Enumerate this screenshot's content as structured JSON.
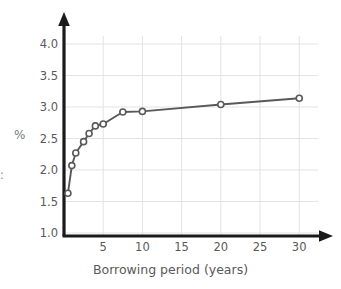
{
  "chart_data": {
    "type": "line",
    "title": "",
    "subtitle": "",
    "xlabel": "Borrowing period (years)",
    "ylabel": "%",
    "xlim": [
      0,
      31.5
    ],
    "ylim": [
      1.0,
      4.2
    ],
    "grid": true,
    "legend": null,
    "series": [
      {
        "name": "Interest rate",
        "marker": "open-circle",
        "color": "#595959",
        "x": [
          0.5,
          1,
          1.5,
          2.5,
          3.2,
          4,
          5,
          7.5,
          10,
          20,
          30
        ],
        "y": [
          1.63,
          2.07,
          2.27,
          2.45,
          2.58,
          2.7,
          2.73,
          2.92,
          2.93,
          3.04,
          3.14
        ]
      }
    ],
    "x_ticks": [
      5,
      10,
      15,
      20,
      25,
      30
    ],
    "x_tick_labels": [
      "5",
      "10",
      "15",
      "20",
      "25",
      "30"
    ],
    "y_ticks": [
      1.0,
      1.5,
      2.0,
      2.5,
      3.0,
      3.5,
      4.0
    ],
    "y_tick_labels": [
      "1.0",
      "1.5",
      "2.0",
      "2.5",
      "3.0",
      "3.5",
      "4.0"
    ]
  },
  "axes": {
    "x_title": "Borrowing period (years)",
    "y_title": "%",
    "left_edge_fragment": ":"
  },
  "colors": {
    "axis": "#1a1a1a",
    "grid": "#e3e3e3",
    "line": "#595959",
    "marker_fill": "#ffffff",
    "text": "#595959",
    "background": "#ffffff"
  }
}
